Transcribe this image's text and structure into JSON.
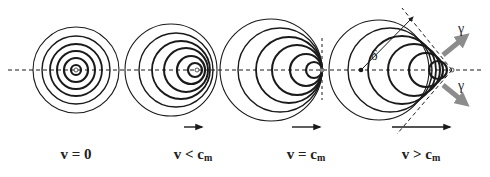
{
  "figure": {
    "panels": [
      {
        "id": "stationary",
        "label_main": "v = 0",
        "label_sub": "",
        "velocity_arrow_length": 0,
        "source": {
          "x": 76,
          "y": 70
        },
        "circles": [
          {
            "cx": 76,
            "r": 5,
            "w": 2.2
          },
          {
            "cx": 76,
            "r": 12,
            "w": 2.2
          },
          {
            "cx": 76,
            "r": 19,
            "w": 2
          },
          {
            "cx": 76,
            "r": 26,
            "w": 1.8
          },
          {
            "cx": 76,
            "r": 34,
            "w": 1.4
          },
          {
            "cx": 76,
            "r": 43,
            "w": 1.1
          }
        ]
      },
      {
        "id": "subsonic",
        "label_main": "v < c",
        "label_sub": "m",
        "velocity_arrow_length": 18,
        "source": {
          "x": 197,
          "y": 70
        },
        "circles": [
          {
            "cx": 195,
            "r": 7,
            "w": 2.2
          },
          {
            "cx": 191,
            "r": 14,
            "w": 2.2
          },
          {
            "cx": 186,
            "r": 22,
            "w": 2
          },
          {
            "cx": 181,
            "r": 29,
            "w": 1.8
          },
          {
            "cx": 176,
            "r": 37,
            "w": 1.4
          },
          {
            "cx": 171,
            "r": 46,
            "w": 1.1
          }
        ]
      },
      {
        "id": "sonic",
        "label_main": "v = c",
        "label_sub": "m",
        "velocity_arrow_length": 28,
        "source": {
          "x": 322,
          "y": 70
        },
        "circles": [
          {
            "cx": 314,
            "r": 8,
            "w": 2.2
          },
          {
            "cx": 306,
            "r": 16,
            "w": 2.2
          },
          {
            "cx": 297,
            "r": 25,
            "w": 2
          },
          {
            "cx": 289,
            "r": 33,
            "w": 1.8
          },
          {
            "cx": 280,
            "r": 42,
            "w": 1.4
          },
          {
            "cx": 271,
            "r": 51,
            "w": 1.1
          }
        ]
      },
      {
        "id": "supersonic",
        "label_main": "v > c",
        "label_sub": "m",
        "velocity_arrow_length": 58,
        "source": {
          "x": 452,
          "y": 70
        },
        "circles": [
          {
            "cx": 438,
            "r": 9,
            "w": 2.2
          },
          {
            "cx": 426,
            "r": 17,
            "w": 2.2
          },
          {
            "cx": 414,
            "r": 26,
            "w": 2
          },
          {
            "cx": 402,
            "r": 34,
            "w": 1.8
          },
          {
            "cx": 390,
            "r": 42,
            "w": 1.4
          },
          {
            "cx": 379,
            "r": 50,
            "w": 1.1
          }
        ],
        "cone_angle_symbol": "δ",
        "emission_symbol": "γ"
      }
    ]
  },
  "colors": {
    "line": "#1a1a1a",
    "gamma_arrow": "#8c8c8c",
    "background": "#ffffff"
  }
}
